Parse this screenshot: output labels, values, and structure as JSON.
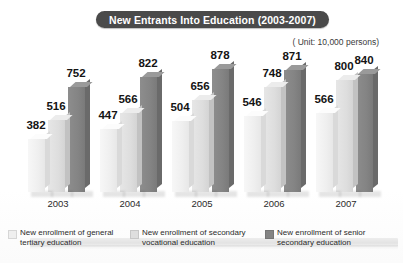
{
  "title": "New Entrants Into Education (2003-2007)",
  "unit_note": "( Unit: 10,000 persons)",
  "legend": {
    "items": [
      {
        "label": "New enrollment of general tertiary education",
        "color": "#efefef"
      },
      {
        "label": "New enrollment of secondary vocational education",
        "color": "#dedede"
      },
      {
        "label": "New enrollment of senior secondary education",
        "color": "#848484"
      }
    ]
  },
  "chart_data": {
    "type": "bar",
    "title": "New Entrants Into Education (2003-2007)",
    "xlabel": "",
    "ylabel": "",
    "unit": "10,000 persons",
    "grid": false,
    "legend_position": "bottom",
    "ylim": [
      0,
      900
    ],
    "categories": [
      "2003",
      "2004",
      "2005",
      "2006",
      "2007"
    ],
    "series": [
      {
        "name": "New enrollment of general tertiary education",
        "color": "#efefef",
        "values": [
          382,
          447,
          504,
          546,
          566
        ]
      },
      {
        "name": "New enrollment of secondary vocational education",
        "color": "#dedede",
        "values": [
          516,
          566,
          656,
          748,
          800
        ]
      },
      {
        "name": "New enrollment of senior secondary education",
        "color": "#848484",
        "values": [
          752,
          822,
          878,
          871,
          840
        ]
      }
    ]
  }
}
